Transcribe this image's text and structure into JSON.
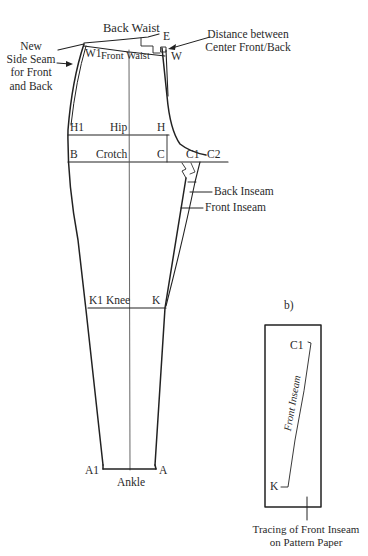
{
  "diagram": {
    "panel_a": {
      "labels": {
        "back_waist": "Back Waist",
        "front_waist": "Front Waist",
        "e": "E",
        "w": "W",
        "w1": "W1",
        "new_side_seam_lines": [
          "New",
          "Side Seam",
          "for Front",
          "and Back"
        ],
        "distance_lines": [
          "Distance between",
          "Center Front/Back"
        ],
        "h1": "H1",
        "hip": "Hip",
        "h": "H",
        "b": "B",
        "crotch": "Crotch",
        "c": "C",
        "c1": "C1",
        "c2": "C2",
        "back_inseam": "Back Inseam",
        "front_inseam": "Front Inseam",
        "k1_knee": "K1 Knee",
        "k": "K",
        "a1": "A1",
        "a": "A",
        "ankle": "Ankle"
      }
    },
    "panel_b": {
      "caption": "b)",
      "box_labels": {
        "c1": "C1",
        "k": "K",
        "front_inseam": "Front Inseam"
      },
      "tracing_caption_lines": [
        "Tracing of Front Inseam",
        "on Pattern Paper"
      ]
    }
  }
}
